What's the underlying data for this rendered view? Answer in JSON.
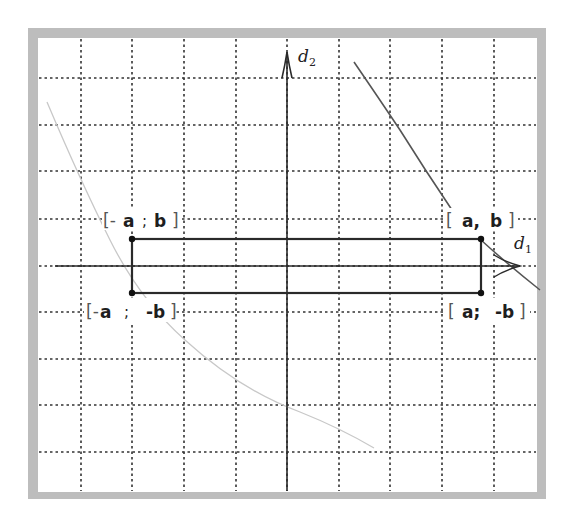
{
  "diagram": {
    "axes": {
      "d1": {
        "name": "d",
        "subscript": "1"
      },
      "d2": {
        "name": "d",
        "subscript": "2"
      }
    },
    "grid": {
      "x_lines": [
        81,
        132,
        184,
        236,
        339,
        390,
        442,
        494
      ],
      "y_lines": [
        78,
        125,
        171,
        219,
        312,
        359,
        405,
        452
      ]
    },
    "rectangle": {
      "corners": [
        {
          "id": "top-left",
          "open": "[-",
          "x_label": "a",
          "sep": ";",
          "y_label": "b",
          "close": "]"
        },
        {
          "id": "top-right",
          "open": "[",
          "x_label": "a,",
          "sep": "",
          "y_label": "b",
          "close": "]"
        },
        {
          "id": "bottom-left",
          "open": "[-",
          "x_label": "a",
          "sep": ";",
          "y_label": "-b",
          "close": "]"
        },
        {
          "id": "bottom-right",
          "open": "[",
          "x_label": "a;",
          "sep": "",
          "y_label": "-b",
          "close": "]"
        }
      ]
    },
    "colors": {
      "frame": "#bdbdbd",
      "grid": "#333333",
      "axes": "#2a2a2a",
      "rectangle": "#2a2a2a",
      "curve_dark": "#555555",
      "curve_light": "#c8c8c8"
    }
  }
}
